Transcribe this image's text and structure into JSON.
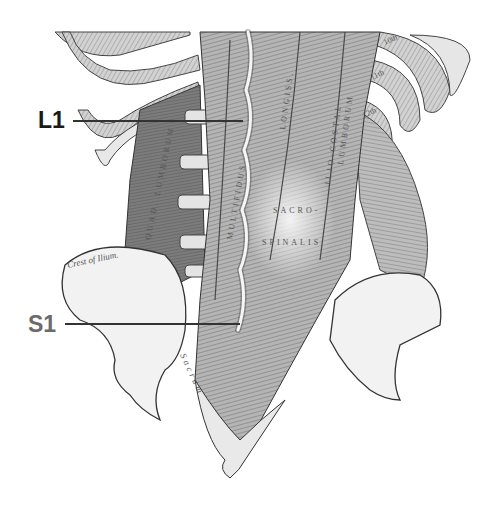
{
  "figure": {
    "colors": {
      "background": "#ffffff",
      "ink": "#3a3a3a",
      "muscle_dark": "#6e6e6e",
      "muscle_mid": "#9a9a9a",
      "muscle_light": "#c8c8c8",
      "bone": "#f2f2f2",
      "l1_label": "#1a1a1a",
      "s1_label": "#6b6b6b",
      "leader_line": "#333333"
    }
  },
  "markers": [
    {
      "id": "L1",
      "label": "L1",
      "x": 38,
      "y": 108,
      "line_x1": 73,
      "line_x2": 243,
      "line_y": 121
    },
    {
      "id": "S1",
      "label": "S1",
      "x": 28,
      "y": 312,
      "line_x1": 65,
      "line_x2": 240,
      "line_y": 324
    }
  ],
  "engraved_labels": {
    "multifidus": "MULTIFIDUS",
    "longissimus": "LONGISS.",
    "iliocostal": "ILIO-COSTAL",
    "lumborum": "LUMBORUM",
    "sacro": "SACRO-",
    "spinalis": "SPINALIS",
    "quadratus_lumborum": "QUAD. LUMBORUM",
    "crest_of_ilium": "Crest of Ilium.",
    "sacrum": "Sacrum",
    "rib_10": "10th",
    "rib_11": "11th",
    "rib_12": "12th"
  }
}
